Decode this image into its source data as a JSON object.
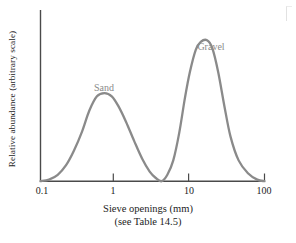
{
  "chart_data": {
    "type": "line",
    "title": "",
    "subtitle": "",
    "xlabel": "Sieve openings (mm)",
    "xlabel_note": "(see Table 14.5)",
    "ylabel": "Relative abundance (arbitrary scale)",
    "xscale": "log",
    "xlim": [
      0.1,
      100
    ],
    "ylim": [
      0,
      1
    ],
    "grid": false,
    "legend": "none",
    "yticks": [],
    "ytick_labels": [],
    "xticks": [
      0.1,
      1,
      10,
      100
    ],
    "xtick_labels": [
      "0.1",
      "1",
      "10",
      "100"
    ],
    "curve_color": "#8a8a8a",
    "axis_color": "#4a4a4a",
    "annotations": [
      {
        "text": "Sand",
        "x": 0.72,
        "y": 0.66
      },
      {
        "text": "Gravel",
        "x": 17,
        "y": 0.98
      }
    ],
    "series": [
      {
        "name": "Grain size distribution",
        "description": "Bimodal distribution: broad sand mode near 0.7 mm and taller narrow gravel mode near 17 mm, with near-zero abundance at about 4 mm",
        "x": [
          0.1,
          0.13,
          0.17,
          0.22,
          0.28,
          0.36,
          0.45,
          0.57,
          0.72,
          0.9,
          1.1,
          1.4,
          1.8,
          2.3,
          2.9,
          3.5,
          4.2,
          5.0,
          6.0,
          7.2,
          8.6,
          10.0,
          12.0,
          14.0,
          17.0,
          20.0,
          24.0,
          29.0,
          35.0,
          45.0,
          60.0,
          80.0,
          100.0
        ],
        "y": [
          0.0,
          0.01,
          0.04,
          0.1,
          0.19,
          0.31,
          0.44,
          0.53,
          0.55,
          0.53,
          0.47,
          0.37,
          0.25,
          0.14,
          0.06,
          0.02,
          0.0,
          0.04,
          0.13,
          0.3,
          0.52,
          0.68,
          0.82,
          0.87,
          0.88,
          0.83,
          0.68,
          0.47,
          0.28,
          0.13,
          0.05,
          0.01,
          0.0
        ],
        "peaks": [
          {
            "label": "Sand",
            "x_mm": 0.72,
            "y": 0.55
          },
          {
            "label": "Gravel",
            "x_mm": 17.0,
            "y": 0.88
          }
        ],
        "minimum": {
          "x_mm": 4.2,
          "y": 0.0
        }
      }
    ]
  }
}
